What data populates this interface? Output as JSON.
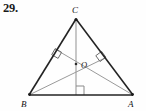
{
  "problem": {
    "number": "29."
  },
  "figure": {
    "kind": "geometry-diagram",
    "background_color": "#fefefe",
    "outline_color": "#1c1c1c",
    "cevian_color": "#8e8e8e",
    "mark_color": "#4a4a4a",
    "label_color": "#111111",
    "vertices": [
      {
        "name": "C",
        "label": "C",
        "x": 76,
        "y": 19,
        "label_x": 72,
        "label_y": 12
      },
      {
        "name": "B",
        "label": "B",
        "x": 29,
        "y": 95,
        "label_x": 24,
        "label_y": 106
      },
      {
        "name": "A",
        "label": "A",
        "x": 133,
        "y": 95,
        "label_x": 130,
        "label_y": 106
      }
    ],
    "interior_point": {
      "name": "O",
      "label": "O",
      "x": 76,
      "y": 64,
      "label_x": 82,
      "label_y": 68
    },
    "feet": [
      {
        "name": "foot-from-C-on-AB",
        "x": 76,
        "y": 95
      },
      {
        "name": "foot-from-B-on-CA",
        "x": 105,
        "y": 58
      },
      {
        "name": "foot-from-A-on-CB",
        "x": 56,
        "y": 50
      }
    ],
    "sides": [
      {
        "name": "side-CB",
        "from": "C",
        "to": "B"
      },
      {
        "name": "side-BA",
        "from": "B",
        "to": "A"
      },
      {
        "name": "side-AC",
        "from": "A",
        "to": "C"
      }
    ],
    "altitudes": [
      {
        "name": "altitude-from-C",
        "from": "C",
        "to": "foot-from-C-on-AB"
      },
      {
        "name": "altitude-from-B",
        "from": "B",
        "to": "foot-from-B-on-CA"
      },
      {
        "name": "altitude-from-A",
        "from": "A",
        "to": "foot-from-A-on-CB"
      }
    ],
    "right_angle_marks": [
      {
        "name": "right-angle-mark-base",
        "x": 76,
        "y": 95
      },
      {
        "name": "right-angle-mark-left",
        "x": 56,
        "y": 50
      },
      {
        "name": "right-angle-mark-right",
        "x": 105,
        "y": 58
      }
    ]
  }
}
